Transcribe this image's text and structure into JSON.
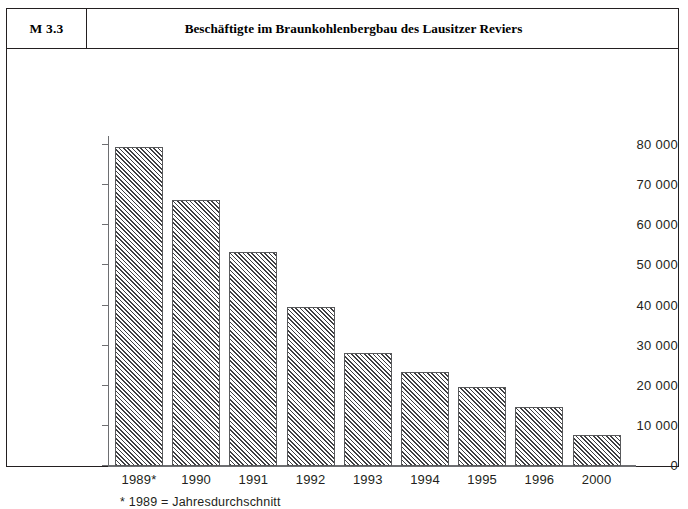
{
  "header": {
    "code": "M 3.3",
    "title": "Beschäftigte im Braunkohlenbergbau des Lausitzer Reviers"
  },
  "footnote": "* 1989 = Jahresdurchschnitt",
  "chart_data": {
    "type": "bar",
    "title": "Beschäftigte im Braunkohlenbergbau des Lausitzer Reviers",
    "xlabel": "",
    "ylabel": "",
    "categories": [
      "1989*",
      "1990",
      "1991",
      "1992",
      "1993",
      "1994",
      "1995",
      "1996",
      "2000"
    ],
    "values": [
      79500,
      66300,
      53300,
      39600,
      28200,
      23400,
      19700,
      14700,
      7700
    ],
    "ylim": [
      0,
      80000
    ],
    "ytick_values": [
      0,
      10000,
      20000,
      30000,
      40000,
      50000,
      60000,
      70000,
      80000
    ],
    "ytick_labels": [
      "0",
      "10 000",
      "20 000",
      "30 000",
      "40 000",
      "50 000",
      "60 000",
      "70 000",
      "80 000"
    ],
    "grid": false,
    "legend": "none",
    "bar_fill": "diagonal-hatch",
    "bar_color": "#3f3f42",
    "axis_color": "#6d6e71",
    "annotations": [
      "* 1989 = Jahresdurchschnitt"
    ]
  }
}
